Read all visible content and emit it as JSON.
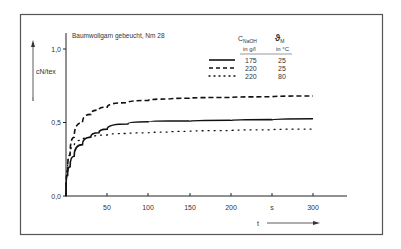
{
  "chart_data": {
    "type": "line",
    "title": "Baumwollgarn gebeucht, Nm 28",
    "xlabel": "t",
    "xunit": "s",
    "ylabel": "cN/tex",
    "xlim": [
      0,
      330
    ],
    "ylim": [
      0.0,
      1.1
    ],
    "x_ticks": [
      50,
      100,
      150,
      200,
      250,
      300
    ],
    "x_tick_labels": [
      "50",
      "100",
      "150",
      "200",
      "s",
      "300"
    ],
    "y_ticks": [
      0.0,
      0.5,
      1.0
    ],
    "y_tick_labels": [
      "0,0",
      "0,5",
      "1,0"
    ],
    "grid": false,
    "legend": {
      "position": "upper-right",
      "header_col1": "C",
      "header_col1_sub": "NaOH",
      "header_col1_unit": "in g/l",
      "header_col2": "ϑ",
      "header_col2_sub": "M",
      "header_col2_unit": "in °C"
    },
    "x": [
      0,
      2,
      5,
      10,
      20,
      30,
      40,
      50,
      75,
      100,
      125,
      150,
      200,
      250,
      300
    ],
    "series": [
      {
        "name": "175 g/l, 25 °C",
        "style": "solid",
        "c_naoh": "175",
        "temp": "25",
        "values": [
          0.0,
          0.14,
          0.2,
          0.27,
          0.35,
          0.4,
          0.43,
          0.455,
          0.49,
          0.505,
          0.51,
          0.51,
          0.515,
          0.52,
          0.525
        ]
      },
      {
        "name": "220 g/l, 25 °C",
        "style": "dashed",
        "c_naoh": "220",
        "temp": "25",
        "values": [
          0.0,
          0.17,
          0.28,
          0.4,
          0.5,
          0.555,
          0.585,
          0.605,
          0.635,
          0.65,
          0.66,
          0.665,
          0.67,
          0.675,
          0.68
        ]
      },
      {
        "name": "220 g/l, 80 °C",
        "style": "dotted",
        "c_naoh": "220",
        "temp": "80",
        "values": [
          0.0,
          0.18,
          0.28,
          0.34,
          0.38,
          0.4,
          0.41,
          0.415,
          0.425,
          0.43,
          0.435,
          0.44,
          0.445,
          0.45,
          0.455
        ]
      }
    ]
  }
}
